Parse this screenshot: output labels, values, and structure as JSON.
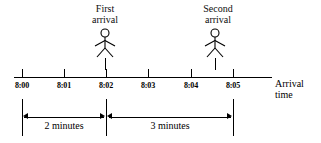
{
  "diagram": {
    "axis": {
      "title_line1": "Arrival",
      "title_line2": "time",
      "ticks": [
        {
          "label": "8:00",
          "x": 22
        },
        {
          "label": "8:01",
          "x": 64
        },
        {
          "label": "8:02",
          "x": 106
        },
        {
          "label": "8:03",
          "x": 148
        },
        {
          "label": "8:04",
          "x": 191
        },
        {
          "label": "8:05",
          "x": 233
        }
      ]
    },
    "events": [
      {
        "name": "first-arrival",
        "label_line1": "First",
        "label_line2": "arrival",
        "time": "8:02",
        "icon": "stick-figure-person-icon"
      },
      {
        "name": "second-arrival",
        "label_line1": "Second",
        "label_line2": "arrival",
        "time": "8:05",
        "icon": "stick-figure-person-icon"
      }
    ],
    "intervals": [
      {
        "name": "first-interval",
        "label": "2 minutes",
        "from": "8:00",
        "to": "8:02"
      },
      {
        "name": "second-interval",
        "label": "3 minutes",
        "from": "8:02",
        "to": "8:05"
      }
    ],
    "colors": {
      "ink": "#000000",
      "background": "#ffffff"
    }
  }
}
